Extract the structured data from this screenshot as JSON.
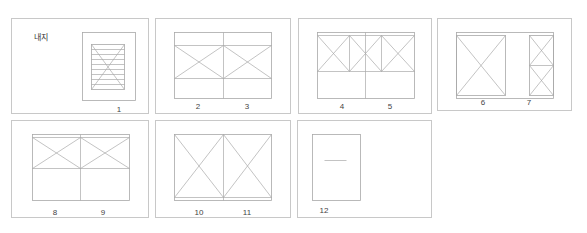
{
  "colors": {
    "line": "#a9a9a9",
    "frame": "#c8c8c8",
    "mid": "#8f8f8f",
    "text": "#444444"
  },
  "panels": [
    {
      "id": "panel-1",
      "x": 11,
      "y": 18,
      "w": 138,
      "h": 96,
      "title": {
        "text": "내지",
        "x": 22,
        "y": 13
      },
      "labels": [
        {
          "text": "1",
          "x": 107,
          "y": 87
        }
      ],
      "rects": [
        {
          "x": 70,
          "y": 13,
          "w": 53,
          "h": 68
        },
        {
          "x": 79,
          "y": 25,
          "w": 33,
          "h": 45
        }
      ],
      "lines": [
        [
          79,
          25,
          112,
          70
        ],
        [
          112,
          25,
          79,
          70
        ],
        [
          79,
          30,
          112,
          30
        ],
        [
          79,
          35,
          112,
          35
        ],
        [
          79,
          40,
          112,
          40
        ],
        [
          79,
          45,
          112,
          45
        ],
        [
          79,
          50,
          112,
          50
        ],
        [
          79,
          55,
          112,
          55
        ],
        [
          79,
          60,
          112,
          60
        ],
        [
          79,
          65,
          112,
          65
        ]
      ]
    },
    {
      "id": "panel-2-3",
      "x": 155,
      "y": 18,
      "w": 136,
      "h": 96,
      "labels": [
        {
          "text": "2",
          "x": 42,
          "y": 84
        },
        {
          "text": "3",
          "x": 91,
          "y": 84
        }
      ],
      "rects": [
        {
          "x": 18,
          "y": 13,
          "w": 97,
          "h": 66
        }
      ],
      "lines": [
        [
          67,
          13,
          67,
          79
        ],
        [
          18,
          26,
          115,
          26
        ],
        [
          18,
          59,
          115,
          59
        ],
        [
          18,
          59,
          67,
          26
        ],
        [
          18,
          26,
          67,
          59
        ],
        [
          67,
          59,
          115,
          26
        ],
        [
          67,
          26,
          115,
          59
        ]
      ]
    },
    {
      "id": "panel-4-5",
      "x": 298,
      "y": 18,
      "w": 134,
      "h": 96,
      "labels": [
        {
          "text": "4",
          "x": 43,
          "y": 84
        },
        {
          "text": "5",
          "x": 91,
          "y": 84
        }
      ],
      "rects": [
        {
          "x": 18,
          "y": 13,
          "w": 97,
          "h": 66
        }
      ],
      "lines": [
        [
          66,
          13,
          66,
          79
        ],
        [
          18,
          16,
          115,
          16
        ],
        [
          18,
          52,
          115,
          52
        ],
        [
          18,
          16,
          50,
          52
        ],
        [
          50,
          16,
          18,
          52
        ],
        [
          50,
          16,
          50,
          52
        ],
        [
          50,
          16,
          82,
          52
        ],
        [
          82,
          16,
          50,
          52
        ],
        [
          82,
          16,
          82,
          52
        ],
        [
          82,
          16,
          115,
          52
        ],
        [
          115,
          16,
          82,
          52
        ]
      ]
    },
    {
      "id": "panel-6-7",
      "x": 437,
      "y": 18,
      "w": 135,
      "h": 93,
      "labels": [
        {
          "text": "6",
          "x": 45,
          "y": 80
        },
        {
          "text": "7",
          "x": 91,
          "y": 80
        }
      ],
      "rects": [
        {
          "x": 18,
          "y": 13,
          "w": 97,
          "h": 66
        },
        {
          "x": 18,
          "y": 16,
          "w": 49,
          "h": 60
        },
        {
          "x": 91,
          "y": 16,
          "w": 24,
          "h": 60
        }
      ],
      "lines": [
        [
          18,
          16,
          67,
          76
        ],
        [
          67,
          16,
          18,
          76
        ],
        [
          91,
          46,
          115,
          46
        ],
        [
          91,
          16,
          115,
          46
        ],
        [
          115,
          16,
          91,
          46
        ],
        [
          91,
          46,
          115,
          76
        ],
        [
          115,
          46,
          91,
          76
        ]
      ]
    },
    {
      "id": "panel-8-9",
      "x": 11,
      "y": 120,
      "w": 138,
      "h": 98,
      "labels": [
        {
          "text": "8",
          "x": 43,
          "y": 88
        },
        {
          "text": "9",
          "x": 91,
          "y": 88
        }
      ],
      "rects": [
        {
          "x": 20,
          "y": 13,
          "w": 97,
          "h": 66
        }
      ],
      "lines": [
        [
          68,
          13,
          68,
          79
        ],
        [
          20,
          16,
          117,
          16
        ],
        [
          20,
          47,
          117,
          47
        ],
        [
          20,
          47,
          68,
          16
        ],
        [
          20,
          16,
          68,
          47
        ],
        [
          68,
          47,
          117,
          16
        ],
        [
          68,
          16,
          117,
          47
        ]
      ]
    },
    {
      "id": "panel-10-11",
      "x": 155,
      "y": 120,
      "w": 136,
      "h": 98,
      "labels": [
        {
          "text": "10",
          "x": 43,
          "y": 88
        },
        {
          "text": "11",
          "x": 91,
          "y": 88
        }
      ],
      "rects": [
        {
          "x": 18,
          "y": 13,
          "w": 97,
          "h": 66
        }
      ],
      "lines": [
        [
          67,
          13,
          67,
          79
        ],
        [
          18,
          76,
          115,
          76
        ],
        [
          18,
          13,
          67,
          76
        ],
        [
          67,
          13,
          18,
          76
        ],
        [
          67,
          13,
          115,
          76
        ],
        [
          115,
          13,
          67,
          76
        ]
      ]
    },
    {
      "id": "panel-12",
      "x": 297,
      "y": 120,
      "w": 135,
      "h": 98,
      "labels": [
        {
          "text": "12",
          "x": 26,
          "y": 86
        }
      ],
      "rects": [
        {
          "x": 14,
          "y": 13,
          "w": 48,
          "h": 66
        }
      ],
      "lines": [
        [
          26,
          39,
          48,
          39
        ]
      ]
    }
  ]
}
